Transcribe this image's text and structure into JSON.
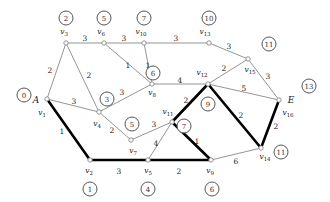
{
  "figure": {
    "kind": "weighted-graph-shortest-path",
    "start_label": "A",
    "end_label": "E",
    "width": 330,
    "height": 202,
    "edge_color": "#7a7a7a",
    "path_color": "#000000",
    "node_color": "#888888"
  },
  "nodes": [
    {
      "id": "v1",
      "name": "v",
      "sub": "1",
      "x": 47,
      "y": 99,
      "dist": "0",
      "dist_x": 24,
      "dist_y": 95,
      "name_x": 42,
      "name_y": 113,
      "end": "A",
      "end_x": 36,
      "end_y": 100
    },
    {
      "id": "v2",
      "name": "v",
      "sub": "2",
      "x": 90,
      "y": 160,
      "dist": "1",
      "dist_x": 90,
      "dist_y": 189,
      "name_x": 89,
      "name_y": 171
    },
    {
      "id": "v3",
      "name": "v",
      "sub": "3",
      "x": 66,
      "y": 43,
      "dist": "2",
      "dist_x": 66,
      "dist_y": 18,
      "name_x": 64,
      "name_y": 32
    },
    {
      "id": "v4",
      "name": "v",
      "sub": "4",
      "x": 99,
      "y": 112,
      "dist": "3",
      "dist_x": 107,
      "dist_y": 99,
      "name_x": 97,
      "name_y": 124
    },
    {
      "id": "v5",
      "name": "v",
      "sub": "5",
      "x": 148,
      "y": 160,
      "dist": "4",
      "dist_x": 148,
      "dist_y": 189,
      "name_x": 148,
      "name_y": 171
    },
    {
      "id": "v6",
      "name": "v",
      "sub": "6",
      "x": 104,
      "y": 43,
      "dist": "5",
      "dist_x": 104,
      "dist_y": 18,
      "name_x": 101,
      "name_y": 32
    },
    {
      "id": "v7",
      "name": "v",
      "sub": "7",
      "x": 131,
      "y": 140,
      "dist": "5",
      "dist_x": 132,
      "dist_y": 124,
      "name_x": 133,
      "name_y": 151
    },
    {
      "id": "v8",
      "name": "v",
      "sub": "8",
      "x": 152,
      "y": 84,
      "dist": "6",
      "dist_x": 153,
      "dist_y": 73,
      "name_x": 152,
      "name_y": 93
    },
    {
      "id": "v9",
      "name": "v",
      "sub": "9",
      "x": 211,
      "y": 160,
      "dist": "6",
      "dist_x": 212,
      "dist_y": 189,
      "name_x": 210,
      "name_y": 171
    },
    {
      "id": "v10",
      "name": "v",
      "sub": "10",
      "x": 144,
      "y": 43,
      "dist": "7",
      "dist_x": 144,
      "dist_y": 18,
      "name_x": 141,
      "name_y": 32
    },
    {
      "id": "v11",
      "name": "v",
      "sub": "11",
      "x": 172,
      "y": 122,
      "dist": "7",
      "dist_x": 184,
      "dist_y": 126,
      "name_x": 168,
      "name_y": 112
    },
    {
      "id": "v12",
      "name": "v",
      "sub": "12",
      "x": 208,
      "y": 84,
      "dist": "9",
      "dist_x": 208,
      "dist_y": 104,
      "name_x": 202,
      "name_y": 73
    },
    {
      "id": "v13",
      "name": "v",
      "sub": "13",
      "x": 209,
      "y": 43,
      "dist": "10",
      "dist_x": 209,
      "dist_y": 18,
      "name_x": 205,
      "name_y": 32
    },
    {
      "id": "v14",
      "name": "v",
      "sub": "14",
      "x": 261,
      "y": 148,
      "dist": "11",
      "dist_x": 281,
      "dist_y": 152,
      "name_x": 265,
      "name_y": 157
    },
    {
      "id": "v15",
      "name": "v",
      "sub": "15",
      "x": 248,
      "y": 59,
      "dist": "11",
      "dist_x": 269,
      "dist_y": 44,
      "name_x": 250,
      "name_y": 70
    },
    {
      "id": "v16",
      "name": "v",
      "sub": "16",
      "x": 279,
      "y": 100,
      "dist": "13",
      "dist_x": 309,
      "dist_y": 86,
      "name_x": 288,
      "name_y": 113,
      "end": "E",
      "end_x": 291,
      "end_y": 100
    }
  ],
  "edges": [
    {
      "from": "v1",
      "to": "v3",
      "weight": "2",
      "wx": 50,
      "wy": 70,
      "bold": false
    },
    {
      "from": "v1",
      "to": "v4",
      "weight": "3",
      "wx": 74,
      "wy": 101,
      "bold": false
    },
    {
      "from": "v1",
      "to": "v2",
      "weight": "1",
      "wx": 62,
      "wy": 131,
      "bold": true
    },
    {
      "from": "v3",
      "to": "v6",
      "weight": "3",
      "wx": 85,
      "wy": 38,
      "bold": false
    },
    {
      "from": "v3",
      "to": "v4",
      "weight": "2",
      "wx": 89,
      "wy": 75,
      "bold": false
    },
    {
      "from": "v6",
      "to": "v10",
      "weight": "3",
      "wx": 124,
      "wy": 38,
      "bold": false
    },
    {
      "from": "v6",
      "to": "v8",
      "weight": "1",
      "wx": 128,
      "wy": 65,
      "bold": false
    },
    {
      "from": "v10",
      "to": "v13",
      "weight": "3",
      "wx": 176,
      "wy": 38,
      "bold": false
    },
    {
      "from": "v10",
      "to": "v8",
      "weight": "1",
      "wx": 148,
      "wy": 65,
      "bold": false
    },
    {
      "from": "v4",
      "to": "v8",
      "weight": "3",
      "wx": 122,
      "wy": 92,
      "bold": false
    },
    {
      "from": "v4",
      "to": "v7",
      "weight": "2",
      "wx": 112,
      "wy": 130,
      "bold": false
    },
    {
      "from": "v2",
      "to": "v5",
      "weight": "3",
      "wx": 119,
      "wy": 171,
      "bold": true
    },
    {
      "from": "v7",
      "to": "v11",
      "weight": "3",
      "wx": 154,
      "wy": 124,
      "bold": false
    },
    {
      "from": "v5",
      "to": "v11",
      "weight": "4",
      "wx": 156,
      "wy": 143,
      "bold": false
    },
    {
      "from": "v5",
      "to": "v9",
      "weight": "2",
      "wx": 179,
      "wy": 171,
      "bold": true
    },
    {
      "from": "v8",
      "to": "v12",
      "weight": "4",
      "wx": 180,
      "wy": 80,
      "bold": false
    },
    {
      "from": "v11",
      "to": "v9",
      "weight": "1",
      "wx": 197,
      "wy": 141,
      "bold": true
    },
    {
      "from": "v11",
      "to": "v12",
      "weight": "2",
      "wx": 186,
      "wy": 100,
      "bold": true
    },
    {
      "from": "v13",
      "to": "v15",
      "weight": "3",
      "wx": 229,
      "wy": 46,
      "bold": false
    },
    {
      "from": "v12",
      "to": "v15",
      "weight": "2",
      "wx": 224,
      "wy": 68,
      "bold": false
    },
    {
      "from": "v12",
      "to": "v16",
      "weight": "5",
      "wx": 244,
      "wy": 88,
      "bold": false
    },
    {
      "from": "v12",
      "to": "v14",
      "weight": "2",
      "wx": 241,
      "wy": 115,
      "bold": true
    },
    {
      "from": "v15",
      "to": "v16",
      "weight": "3",
      "wx": 268,
      "wy": 76,
      "bold": false
    },
    {
      "from": "v9",
      "to": "v14",
      "weight": "6",
      "wx": 236,
      "wy": 161,
      "bold": false
    },
    {
      "from": "v14",
      "to": "v16",
      "weight": "2",
      "wx": 276,
      "wy": 126,
      "bold": true
    }
  ]
}
